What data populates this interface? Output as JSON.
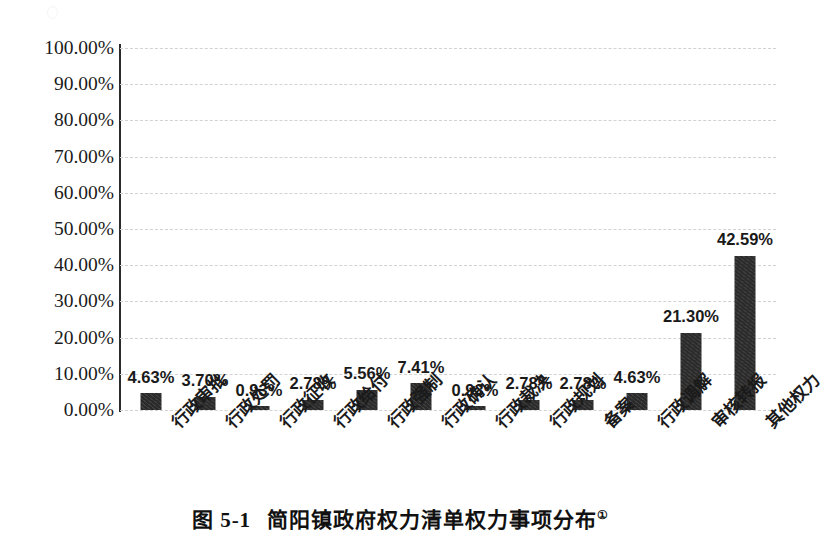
{
  "chart_data": {
    "type": "bar",
    "title": "",
    "xlabel": "",
    "ylabel": "",
    "ylim": [
      0,
      100
    ],
    "ytick_labels": [
      "100.00%",
      "90.00%",
      "80.00%",
      "70.00%",
      "60.00%",
      "50.00%",
      "40.00%",
      "30.00%",
      "20.00%",
      "10.00%",
      "0.00%"
    ],
    "ytick_values": [
      100,
      90,
      80,
      70,
      60,
      50,
      40,
      30,
      20,
      10,
      0
    ],
    "grid": true,
    "legend": "none",
    "categories": [
      "行政审批",
      "行政处罚",
      "行政征收",
      "行政给付",
      "行政强制",
      "行政确认",
      "行政裁决",
      "行政规划",
      "备案",
      "行政调解",
      "审核转报",
      "其他权力"
    ],
    "values": [
      4.63,
      3.7,
      0.93,
      2.78,
      5.56,
      7.41,
      0.93,
      2.78,
      2.78,
      4.63,
      21.3,
      42.59
    ],
    "data_labels": [
      "4.63%",
      "3.70%",
      "0.93%",
      "2.78%",
      "5.56%",
      "7.41%",
      "0.93%",
      "2.78%",
      "2.78%",
      "4.63%",
      "21.30%",
      "42.59%"
    ],
    "bar_color": "#2a2a2a"
  },
  "caption": {
    "number": "图 5-1",
    "text": "简阳镇政府权力清单权力事项分布",
    "footnote_marker": "①"
  }
}
